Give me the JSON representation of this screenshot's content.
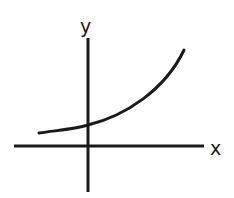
{
  "diagram": {
    "type": "exponential-growth-sketch",
    "axes": {
      "x_label": "x",
      "y_label": "y"
    },
    "curve": {
      "description": "increasing exponential curve, positive y-intercept, approaching x-axis asymptotically to the left"
    },
    "colors": {
      "stroke": "#1a1a1a",
      "background": "#ffffff"
    }
  }
}
